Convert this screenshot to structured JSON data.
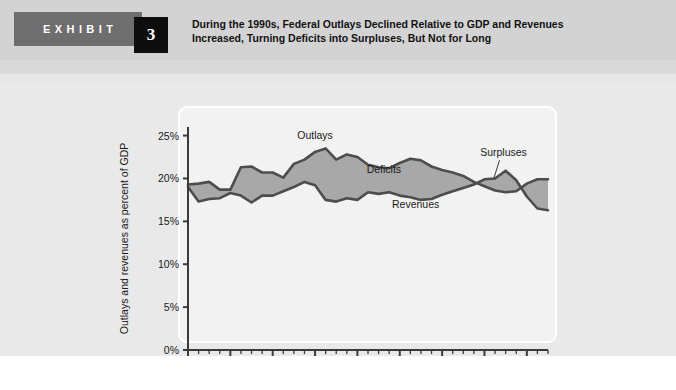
{
  "header": {
    "exhibit_label": "EXHIBIT",
    "exhibit_number": "3",
    "title_line1": "During the 1990s, Federal Outlays Declined Relative to GDP and Revenues",
    "title_line2": "Increased, Turning Deficits into Surpluses, But Not for Long"
  },
  "colors": {
    "band": "#d3d3d3",
    "badge": "#6e6e6e",
    "number_box": "#0d0d0d",
    "chart_bg": "#e9e9e9",
    "panel": "#f2f2f2",
    "line": "#4d4d4d",
    "fill": "#a8a8a8",
    "footer_bar": "#8c8c8c"
  },
  "chart_data": {
    "type": "area",
    "title": "During the 1990s, Federal Outlays Declined Relative to GDP and Revenues Increased, Turning Deficits into Surpluses, But Not for Long",
    "xlabel": "",
    "ylabel": "Outlays and revenues as percent of GDP",
    "xlim": [
      1970,
      2004
    ],
    "ylim": [
      0,
      26
    ],
    "ytick_values": [
      0,
      5,
      10,
      15,
      20,
      25
    ],
    "ytick_labels": [
      "0%",
      "5%",
      "10%",
      "15%",
      "20%",
      "25%"
    ],
    "xtick_values": [
      1970,
      1974,
      1978,
      1982,
      1986,
      1990,
      1994,
      1998,
      2002
    ],
    "xtick_labels": [
      "1970",
      "1974",
      "1978",
      "1982",
      "1986",
      "1990",
      "1994",
      "1998",
      "2002"
    ],
    "xtick_minor_step": 1,
    "grid": false,
    "legend_position": "inline-annotations",
    "annotations": [
      {
        "text": "Outlays",
        "x": 1982,
        "y": 24.6
      },
      {
        "text": "Deficits",
        "x": 1988.5,
        "y": 20.6
      },
      {
        "text": "Revenues",
        "x": 1991.5,
        "y": 16.6
      },
      {
        "text": "Surpluses",
        "x": 1999.8,
        "y": 22.6
      }
    ],
    "x": [
      1970,
      1971,
      1972,
      1973,
      1974,
      1975,
      1976,
      1977,
      1978,
      1979,
      1980,
      1981,
      1982,
      1983,
      1984,
      1985,
      1986,
      1987,
      1988,
      1989,
      1990,
      1991,
      1992,
      1993,
      1994,
      1995,
      1996,
      1997,
      1998,
      1999,
      2000,
      2001,
      2002,
      2003,
      2004
    ],
    "series": [
      {
        "name": "Outlays",
        "values": [
          19.3,
          19.4,
          19.6,
          18.7,
          18.7,
          21.3,
          21.4,
          20.7,
          20.7,
          20.1,
          21.7,
          22.2,
          23.1,
          23.5,
          22.2,
          22.8,
          22.5,
          21.6,
          21.3,
          21.2,
          21.8,
          22.3,
          22.1,
          21.4,
          21.0,
          20.7,
          20.3,
          19.6,
          19.1,
          18.6,
          18.4,
          18.5,
          19.4,
          19.9,
          19.9
        ]
      },
      {
        "name": "Revenues",
        "values": [
          19.0,
          17.3,
          17.6,
          17.7,
          18.3,
          18.0,
          17.2,
          18.0,
          18.0,
          18.5,
          19.0,
          19.6,
          19.2,
          17.5,
          17.3,
          17.7,
          17.5,
          18.4,
          18.2,
          18.4,
          18.0,
          17.8,
          17.5,
          17.6,
          18.1,
          18.5,
          18.9,
          19.3,
          19.9,
          20.0,
          20.9,
          19.8,
          17.9,
          16.5,
          16.3
        ]
      }
    ]
  }
}
